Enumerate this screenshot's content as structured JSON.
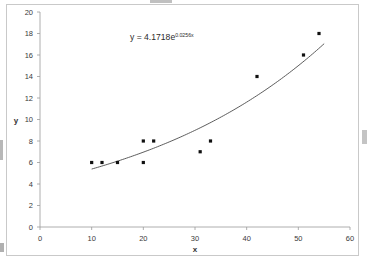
{
  "chart_data": {
    "type": "scatter",
    "title": "",
    "xlabel": "x",
    "ylabel": "y",
    "xlim": [
      0,
      60
    ],
    "ylim": [
      0,
      20
    ],
    "xticks": [
      0,
      10,
      20,
      30,
      40,
      50,
      60
    ],
    "yticks": [
      0,
      2,
      4,
      6,
      8,
      10,
      12,
      14,
      16,
      18,
      20
    ],
    "grid": false,
    "legend": false,
    "series": [
      {
        "name": "data",
        "marker": "square",
        "color": "#101010",
        "points": [
          {
            "x": 10,
            "y": 6
          },
          {
            "x": 12,
            "y": 6
          },
          {
            "x": 15,
            "y": 6
          },
          {
            "x": 20,
            "y": 8
          },
          {
            "x": 20,
            "y": 6
          },
          {
            "x": 22,
            "y": 8
          },
          {
            "x": 31,
            "y": 7
          },
          {
            "x": 33,
            "y": 8
          },
          {
            "x": 42,
            "y": 14
          },
          {
            "x": 51,
            "y": 16
          },
          {
            "x": 54,
            "y": 18
          }
        ]
      }
    ],
    "trendline": {
      "type": "exponential",
      "coefficient": 4.1718,
      "rate": 0.0256,
      "x_start": 10,
      "x_end": 55,
      "color": "#4a4a4a"
    },
    "annotations": [
      {
        "name": "trendline-equation",
        "text_base": "y = 4.1718e",
        "text_exponent": "0.0256x",
        "x_px": 130,
        "y_px": 40
      }
    ]
  },
  "axes": {
    "x_title": "x",
    "y_title": "y",
    "x_tick_labels": [
      "0",
      "10",
      "20",
      "30",
      "40",
      "50",
      "60"
    ],
    "y_tick_labels": [
      "0",
      "2",
      "4",
      "6",
      "8",
      "10",
      "12",
      "14",
      "16",
      "18",
      "20"
    ]
  },
  "equation": {
    "base": "y = 4.1718e",
    "exponent": "0.0256x"
  },
  "colors": {
    "background": "#ffffff",
    "border": "#c9c9c9",
    "axis": "#9a9a9a",
    "marker": "#101010",
    "curve": "#4a4a4a",
    "text": "#3a3a3a"
  }
}
